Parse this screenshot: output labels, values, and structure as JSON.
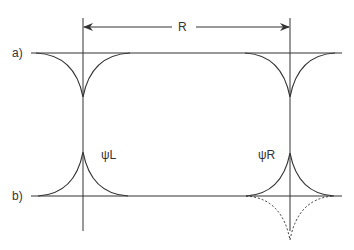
{
  "diagram": {
    "labels": {
      "distance": "R",
      "row_a": "a)",
      "row_b": "b)",
      "psi_left": "ψL",
      "psi_right": "ψR"
    },
    "colors": {
      "line": "#333333",
      "background": "#ffffff"
    },
    "elements": [
      {
        "type": "dimension-arrow",
        "label": "R",
        "from": "left-vertical",
        "to": "right-vertical"
      },
      {
        "type": "row",
        "label": "a)",
        "description": "two downward cusps (wells) on a horizontal baseline at left and right positions"
      },
      {
        "type": "row",
        "label": "b)",
        "description": "two upward cusps labelled ψL and ψR on a horizontal baseline; dashed downward cusp mirrored under ψR"
      }
    ]
  }
}
